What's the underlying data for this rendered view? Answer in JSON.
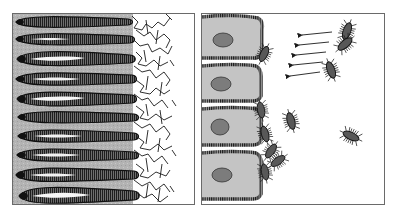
{
  "figure": {
    "panels": [
      {
        "id": "left",
        "subject": "villi-and-mucus-layer",
        "villi_count": 10,
        "elements": [
          "elongated finger-like villi with striated brush border",
          "tangled mucus mesh at tips"
        ]
      },
      {
        "id": "right",
        "subject": "epithelial-cells-and-bacteria",
        "cell_count": 4,
        "bacteria_count": 11,
        "arrow_count": 5,
        "elements": [
          "columnar epithelial cells with nuclei",
          "adherent bacteria at cell surface",
          "free bacteria",
          "arrows pointing toward cells"
        ]
      }
    ]
  },
  "colors": {
    "background": "#ffffff",
    "panel_border": "#6a6a6a",
    "tissue_fill": "#b8b8b8",
    "villus_dark": "#2a2a2a",
    "villus_body": "#7a7a7a",
    "villus_highlight": "#f4f4f4",
    "cell_fill": "#c4c4c4",
    "nucleus_fill": "#7c7c7c",
    "bacterium_fill": "#555555",
    "line": "#1a1a1a"
  }
}
